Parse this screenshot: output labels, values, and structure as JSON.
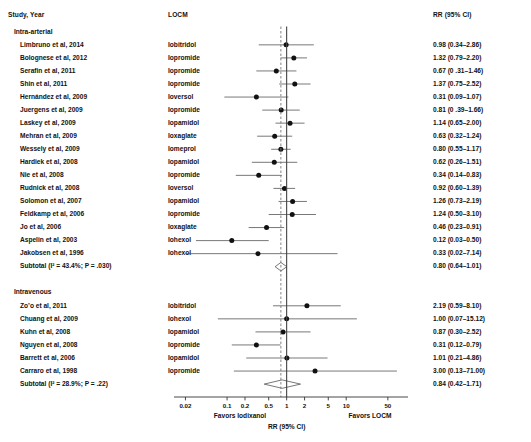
{
  "header": {
    "study_col": "Study, Year",
    "locm_col": "LOCM",
    "rr_col": "RR (95% CI)"
  },
  "axis": {
    "title": "RR (95% CI)",
    "favors_left": "Favors Iodixanol",
    "favors_right": "Favors LOCM",
    "ticks": [
      "0.02",
      "0.1",
      "0.2",
      "0.5",
      "1",
      "2",
      "5",
      "10",
      "50"
    ],
    "tick_values": [
      0.02,
      0.1,
      0.2,
      0.5,
      1,
      2,
      5,
      10,
      50
    ],
    "ref_line": 1,
    "pooled_line": 0.8
  },
  "groups": [
    {
      "label": "Intra-arterial",
      "studies": [
        {
          "name": "Limbruno et al, 2014",
          "locm": "Iobitridol",
          "rr": "0.98 (0.34–2.86)"
        },
        {
          "name": "Bolognese et al, 2012",
          "locm": "Iopromide",
          "rr": "1.32 (0.79–2.20)"
        },
        {
          "name": "Serafin et al, 2011",
          "locm": "Iopromide",
          "rr": "0.67 (0 .31–1.46)"
        },
        {
          "name": "Shin et al, 2011",
          "locm": "Iopromide",
          "rr": "1.37 (0.75–2.52)"
        },
        {
          "name": "Hernández et al, 2009",
          "locm": "Ioversol",
          "rr": "0.31 (0.09–1.07)"
        },
        {
          "name": "Juergens et al, 2009",
          "locm": "Iopromide",
          "rr": "0.81 (0 .39–1.66)"
        },
        {
          "name": "Laskey et al, 2009",
          "locm": "Iopamidol",
          "rr": "1.14 (0.65–2.00)"
        },
        {
          "name": "Mehran et al, 2009",
          "locm": "Ioxaglate",
          "rr": "0.63 (0.32–1.24)"
        },
        {
          "name": "Wessely et al, 2009",
          "locm": "Iomeprol",
          "rr": "0.80 (0.55–1.17)"
        },
        {
          "name": "Hardiek et al, 2008",
          "locm": "Iopamidol",
          "rr": "0.62 (0.26–1.51)"
        },
        {
          "name": "Nie et al, 2008",
          "locm": "Iopromide",
          "rr": "0.34 (0.14–0.83)"
        },
        {
          "name": "Rudnick et al, 2008",
          "locm": "Ioversol",
          "rr": "0.92 (0.60–1.39)"
        },
        {
          "name": "Solomon et al, 2007",
          "locm": "Iopamidol",
          "rr": "1.26 (0.73–2.19)"
        },
        {
          "name": "Feldkamp et al, 2006",
          "locm": "Iopromide",
          "rr": "1.24 (0.50–3.10)"
        },
        {
          "name": "Jo et al, 2006",
          "locm": "Ioxaglate",
          "rr": "0.46 (0.23–0.91)"
        },
        {
          "name": "Aspelin et al, 2003",
          "locm": "Iohexol",
          "rr": "0.12 (0.03–0.50)"
        },
        {
          "name": "Jakobsen et al, 1996",
          "locm": "Iohexol",
          "rr": "0.33 (0.02–7.14)"
        }
      ],
      "subtotal": {
        "name": "Subtotal (I² = 43.4%; P = .030)",
        "locm": "",
        "rr": "0.80 (0.64–1.01)"
      }
    },
    {
      "label": "Intravenous",
      "studies": [
        {
          "name": "Zo’o et al, 2011",
          "locm": "Iobitridol",
          "rr": "2.19 (0.59–8.10)"
        },
        {
          "name": "Chuang et al, 2009",
          "locm": "Iohexol",
          "rr": "1.00 (0.07–15.12)"
        },
        {
          "name": "Kuhn et al, 2008",
          "locm": "Iopamidol",
          "rr": "0.87 (0.30–2.52)"
        },
        {
          "name": "Nguyen et al, 2008",
          "locm": "Iopromide",
          "rr": "0.31 (0.12–0.79)"
        },
        {
          "name": "Barrett et al, 2006",
          "locm": "Iopamidol",
          "rr": "1.01 (0.21–4.86)"
        },
        {
          "name": "Carraro et al, 1998",
          "locm": "Iopromide",
          "rr": "3.00 (0.13–71.00)"
        }
      ],
      "subtotal": {
        "name": "Subtotal (I² = 28.9%; P = .22)",
        "locm": "",
        "rr": "0.84 (0.42–1.71)"
      }
    }
  ],
  "chart_data": {
    "type": "forest",
    "title": "",
    "xlabel": "RR (95% CI)",
    "xscale": "log",
    "xlim": [
      0.015,
      80
    ],
    "xticks": [
      0.02,
      0.1,
      0.2,
      0.5,
      1,
      2,
      5,
      10,
      50
    ],
    "reference_line": 1,
    "grid": false,
    "legend": "none",
    "annotations": [
      "Favors Iodixanol",
      "Favors LOCM"
    ],
    "rows": [
      {
        "label": "Intra-arterial",
        "kind": "group"
      },
      {
        "label": "Limbruno et al, 2014",
        "kind": "study",
        "rr": 0.98,
        "lo": 0.34,
        "hi": 2.86
      },
      {
        "label": "Bolognese et al, 2012",
        "kind": "study",
        "rr": 1.32,
        "lo": 0.79,
        "hi": 2.2
      },
      {
        "label": "Serafin et al, 2011",
        "kind": "study",
        "rr": 0.67,
        "lo": 0.31,
        "hi": 1.46
      },
      {
        "label": "Shin et al, 2011",
        "kind": "study",
        "rr": 1.37,
        "lo": 0.75,
        "hi": 2.52
      },
      {
        "label": "Hernández et al, 2009",
        "kind": "study",
        "rr": 0.31,
        "lo": 0.09,
        "hi": 1.07
      },
      {
        "label": "Juergens et al, 2009",
        "kind": "study",
        "rr": 0.81,
        "lo": 0.39,
        "hi": 1.66
      },
      {
        "label": "Laskey et al, 2009",
        "kind": "study",
        "rr": 1.14,
        "lo": 0.65,
        "hi": 2.0
      },
      {
        "label": "Mehran et al, 2009",
        "kind": "study",
        "rr": 0.63,
        "lo": 0.32,
        "hi": 1.24
      },
      {
        "label": "Wessely et al, 2009",
        "kind": "study",
        "rr": 0.8,
        "lo": 0.55,
        "hi": 1.17
      },
      {
        "label": "Hardiek et al, 2008",
        "kind": "study",
        "rr": 0.62,
        "lo": 0.26,
        "hi": 1.51
      },
      {
        "label": "Nie et al, 2008",
        "kind": "study",
        "rr": 0.34,
        "lo": 0.14,
        "hi": 0.83
      },
      {
        "label": "Rudnick et al, 2008",
        "kind": "study",
        "rr": 0.92,
        "lo": 0.6,
        "hi": 1.39
      },
      {
        "label": "Solomon et al, 2007",
        "kind": "study",
        "rr": 1.26,
        "lo": 0.73,
        "hi": 2.19
      },
      {
        "label": "Feldkamp et al, 2006",
        "kind": "study",
        "rr": 1.24,
        "lo": 0.5,
        "hi": 3.1
      },
      {
        "label": "Jo et al, 2006",
        "kind": "study",
        "rr": 0.46,
        "lo": 0.23,
        "hi": 0.91
      },
      {
        "label": "Aspelin et al, 2003",
        "kind": "study",
        "rr": 0.12,
        "lo": 0.03,
        "hi": 0.5
      },
      {
        "label": "Jakobsen et al, 1996",
        "kind": "study",
        "rr": 0.33,
        "lo": 0.02,
        "hi": 7.14
      },
      {
        "label": "Subtotal (I² = 43.4%; P = .030)",
        "kind": "subtotal",
        "rr": 0.8,
        "lo": 0.64,
        "hi": 1.01
      },
      {
        "label": "Intravenous",
        "kind": "group"
      },
      {
        "label": "Zo’o et al, 2011",
        "kind": "study",
        "rr": 2.19,
        "lo": 0.59,
        "hi": 8.1
      },
      {
        "label": "Chuang et al, 2009",
        "kind": "study",
        "rr": 1.0,
        "lo": 0.07,
        "hi": 15.12
      },
      {
        "label": "Kuhn et al, 2008",
        "kind": "study",
        "rr": 0.87,
        "lo": 0.3,
        "hi": 2.52
      },
      {
        "label": "Nguyen et al, 2008",
        "kind": "study",
        "rr": 0.31,
        "lo": 0.12,
        "hi": 0.79
      },
      {
        "label": "Barrett et al, 2006",
        "kind": "study",
        "rr": 1.01,
        "lo": 0.21,
        "hi": 4.86
      },
      {
        "label": "Carraro et al, 1998",
        "kind": "study",
        "rr": 3.0,
        "lo": 0.13,
        "hi": 71.0
      },
      {
        "label": "Subtotal (I² = 28.9%; P = .22)",
        "kind": "subtotal",
        "rr": 0.84,
        "lo": 0.42,
        "hi": 1.71
      }
    ]
  }
}
